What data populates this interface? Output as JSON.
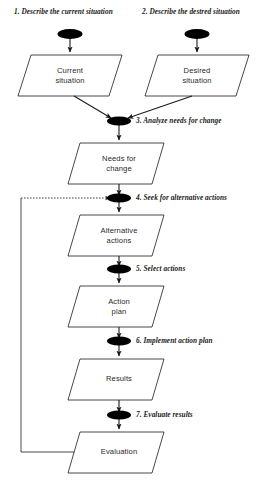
{
  "diagram": {
    "type": "flowchart",
    "colors": {
      "stroke": "#1a1a1a",
      "fill": "#ffffff",
      "ellipse_fill": "#000000",
      "background": "#ffffff"
    },
    "step_labels": [
      {
        "id": "step-1",
        "text": "1. Describe the current situation",
        "x": 14,
        "y": 7
      },
      {
        "id": "step-2",
        "text": "2. Describe the destred situation",
        "x": 142,
        "y": 7
      },
      {
        "id": "step-3",
        "text": "3. Analyze needs for change",
        "x": 136,
        "y": 115
      },
      {
        "id": "step-4",
        "text": "4. Seek for alternative actions",
        "x": 136,
        "y": 193
      },
      {
        "id": "step-5",
        "text": "5. Select actions",
        "x": 136,
        "y": 261
      },
      {
        "id": "step-6",
        "text": "6. Implement action plan",
        "x": 136,
        "y": 333
      },
      {
        "id": "step-7",
        "text": "7. Evaluate results",
        "x": 136,
        "y": 408
      }
    ],
    "nodes": [
      {
        "id": "current-situation",
        "label": "Current\nsituation",
        "cx": 70,
        "cy": 75
      },
      {
        "id": "desired-situation",
        "label": "Desired\nsituation",
        "cx": 197,
        "cy": 75
      },
      {
        "id": "needs-for-change",
        "label": "Needs for\nchange",
        "cx": 119,
        "cy": 163
      },
      {
        "id": "alternative-actions",
        "label": "Alternative\nactions",
        "cx": 119,
        "cy": 235
      },
      {
        "id": "action-plan",
        "label": "Action\nplan",
        "cx": 119,
        "cy": 306
      },
      {
        "id": "results",
        "label": "Results",
        "cx": 119,
        "cy": 379
      },
      {
        "id": "evaluation",
        "label": "Evaluation",
        "cx": 119,
        "cy": 452
      }
    ],
    "connectors": [
      {
        "id": "ellipse-1",
        "cx": 70,
        "cy": 34
      },
      {
        "id": "ellipse-2",
        "cx": 197,
        "cy": 34
      },
      {
        "id": "ellipse-3",
        "cx": 119,
        "cy": 121
      },
      {
        "id": "ellipse-4",
        "cx": 119,
        "cy": 198
      },
      {
        "id": "ellipse-5",
        "cx": 119,
        "cy": 269
      },
      {
        "id": "ellipse-6",
        "cx": 119,
        "cy": 341
      },
      {
        "id": "ellipse-7",
        "cx": 119,
        "cy": 415
      }
    ],
    "feedback_loop": {
      "id": "feedback-loop",
      "style": "solid-with-dashed-segment",
      "from": "evaluation",
      "to": "ellipse-4"
    }
  }
}
